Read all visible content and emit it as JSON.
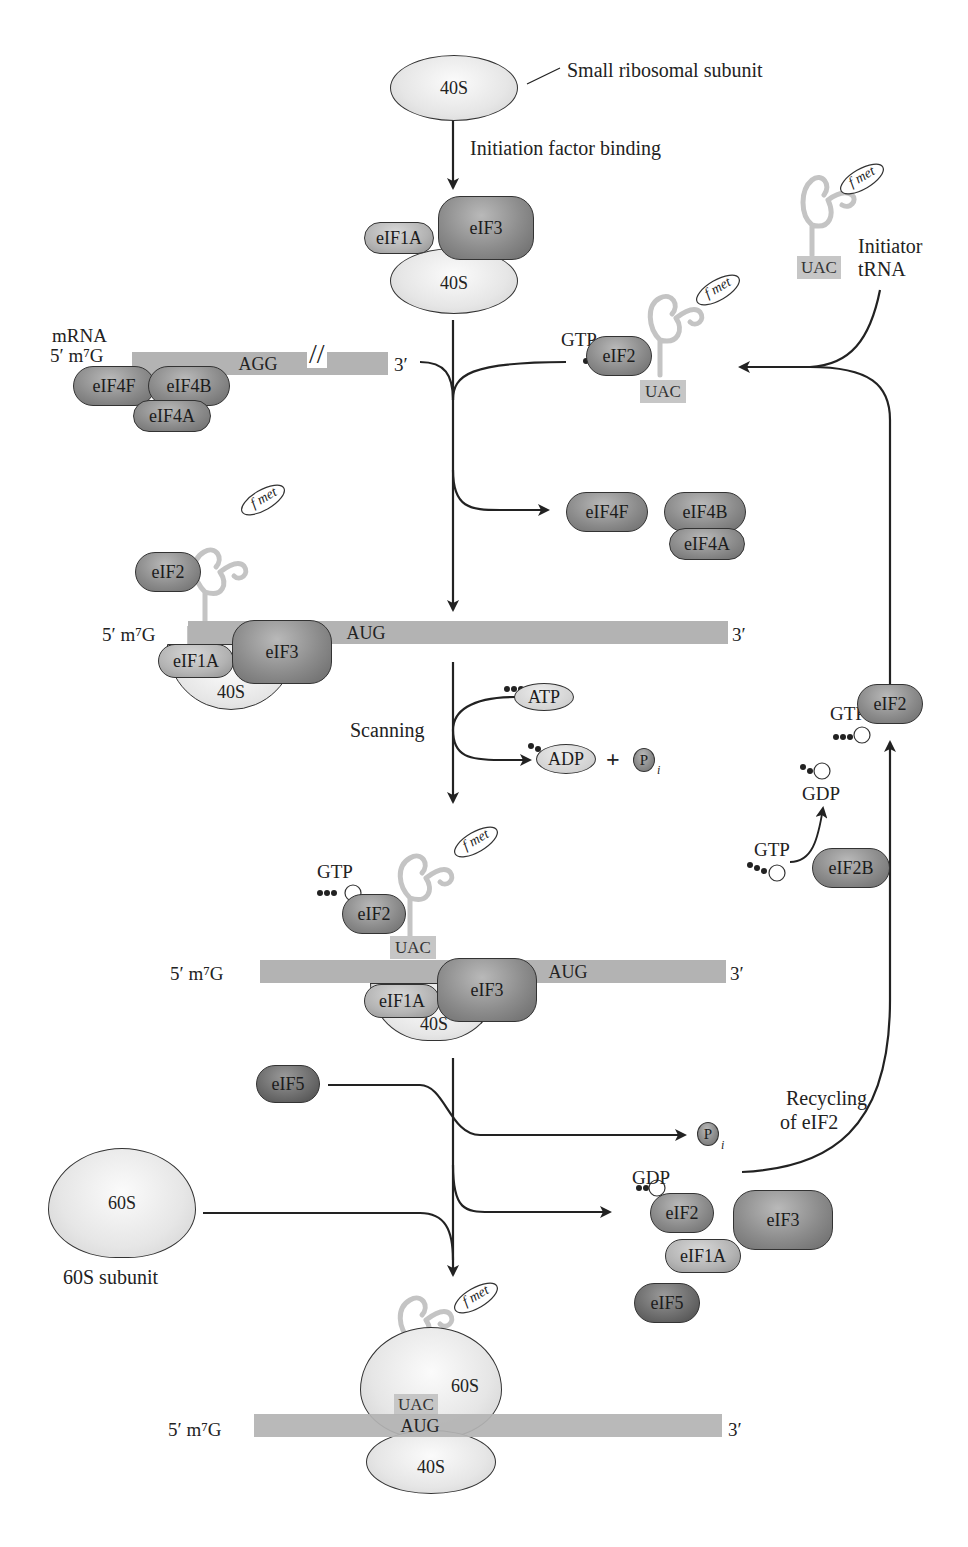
{
  "figure": {
    "type": "flow-diagram"
  },
  "labels": {
    "small_subunit_caption": "Small ribosomal subunit",
    "initiation_factor_binding": "Initiation factor binding",
    "scanning": "Scanning",
    "recycling_line1": "Recycling",
    "recycling_line2": "of eIF2",
    "initiator_line1": "Initiator",
    "initiator_line2": "tRNA",
    "subunit_60s_caption": "60S subunit",
    "mrna": "mRNA",
    "five_prime_cap": "5′  m⁷G",
    "three_prime": "3′",
    "plus": "+"
  },
  "molecules": {
    "s40": "40S",
    "s60": "60S",
    "eif1a": "eIF1A",
    "eif3": "eIF3",
    "eif2": "eIF2",
    "eif2b": "eIF2B",
    "eif4f": "eIF4F",
    "eif4b": "eIF4B",
    "eif4a": "eIF4A",
    "eif5": "eIF5",
    "gtp": "GTP",
    "gdp": "GDP",
    "atp": "ATP",
    "adp": "ADP",
    "pi": "P",
    "pi_sub": "i",
    "fmet": "f met",
    "uac": "UAC",
    "aug": "AUG",
    "agg": "AGG"
  },
  "stages": [
    {
      "id": "free-40s",
      "components": [
        "40S"
      ]
    },
    {
      "id": "43s-complex",
      "components": [
        "40S",
        "eIF1A",
        "eIF3"
      ]
    },
    {
      "id": "mrna-cap-binding",
      "components": [
        "mRNA",
        "eIF4F",
        "eIF4B",
        "eIF4A"
      ]
    },
    {
      "id": "scanning-complex",
      "components": [
        "40S",
        "eIF1A",
        "eIF3",
        "eIF2",
        "Met-tRNA"
      ]
    },
    {
      "id": "aug-recognition",
      "components": [
        "40S",
        "eIF1A",
        "eIF3",
        "eIF2·GTP",
        "Met-tRNA"
      ]
    },
    {
      "id": "80s-initiation-complex",
      "components": [
        "40S",
        "60S",
        "Met-tRNA"
      ]
    }
  ]
}
